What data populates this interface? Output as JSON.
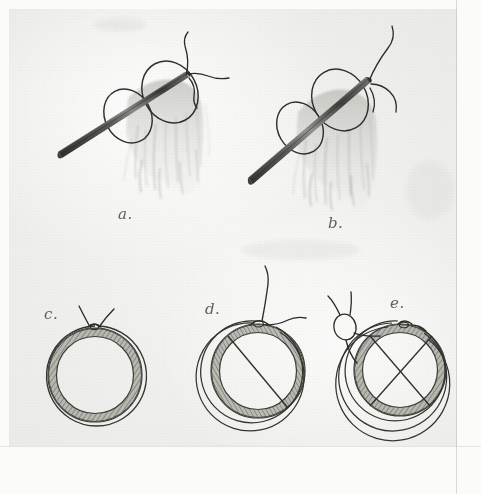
{
  "figure": {
    "kind": "pencil-illustration",
    "medium": "graphite pencil on paper, scanned",
    "title": "Suture ligature technique, five stages",
    "background_color": "#eeeeec",
    "ink_color": "#3a3a38",
    "shade_color": "#8d8d88"
  },
  "panels": [
    {
      "id": "a",
      "label": "a.",
      "label_x": 118,
      "label_y": 205,
      "description": "Needle passed through vessel stump with two encircling ligature loops; free suture ends emerge at needle tip"
    },
    {
      "id": "b",
      "label": "b.",
      "label_x": 328,
      "label_y": 214,
      "description": "Needle advanced further through stump; long suture tails drawn upward and to the right"
    },
    {
      "id": "c",
      "label": "c.",
      "label_x": 44,
      "label_y": 305,
      "description": "Cross section of vessel showing single encircling ligature tied at top with two free ends"
    },
    {
      "id": "d",
      "label": "d.",
      "label_x": 205,
      "label_y": 300,
      "description": "Cross section with encircling ligature plus one transfixion suture crossing the lumen diagonally"
    },
    {
      "id": "e",
      "label": "e.",
      "label_x": 390,
      "label_y": 294,
      "description": "Cross section with encircling ligature plus two crossed transfixion sutures forming an X, knot at upper left"
    }
  ],
  "elements": {
    "needle": "surgical-needle",
    "loops": "ligature-loops",
    "thread": "suture-thread",
    "stump": "vessel-stump",
    "ring_wall": "vessel-wall-cross-section",
    "knot": "surgical-knot",
    "chord": "transfixion-suture"
  }
}
